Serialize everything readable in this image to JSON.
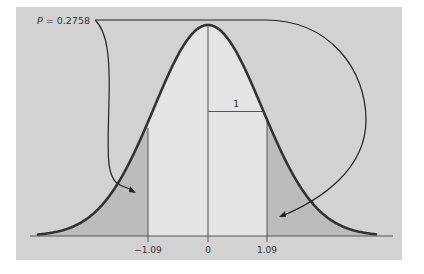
{
  "figure": {
    "p_label_prefix": "P",
    "p_label_rest": " = 0.2758",
    "unit_label": "1",
    "ticks": [
      {
        "label": "−1.09",
        "value": -1.09
      },
      {
        "label": "0",
        "value": 0
      },
      {
        "label": "1.09",
        "value": 1.09
      }
    ]
  },
  "colors": {
    "panel": "#d2d2d2",
    "center_fill": "#e4e4e4",
    "tail_fill": "#bdbdbd",
    "curve": "#333333",
    "lines": "#555555"
  }
}
